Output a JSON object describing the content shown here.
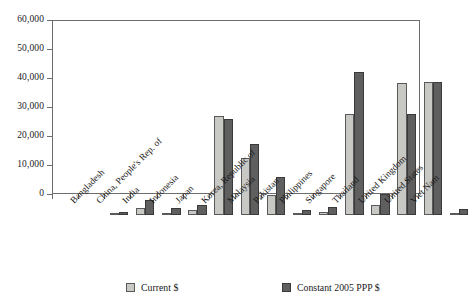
{
  "chart_data": {
    "type": "bar",
    "title": "",
    "xlabel": "",
    "ylabel": "",
    "ylim": [
      0,
      60000
    ],
    "grid": false,
    "legend_position": "bottom",
    "ytick_labels": [
      "0",
      "10,000",
      "20,000",
      "30,000",
      "40,000",
      "50,000",
      "60,000"
    ],
    "ytick_values": [
      0,
      10000,
      20000,
      30000,
      40000,
      50000,
      60000
    ],
    "categories": [
      "Bangladesh",
      "China, People's Rep. of",
      "India",
      "Indonesia",
      "Japan",
      "Korea, Republic of",
      "Malaysia",
      "Pakistan",
      "Philippines",
      "Singapore",
      "Thailand",
      "United Kingdom",
      "United States",
      "Viet Nam"
    ],
    "series": [
      {
        "name": "Current $",
        "color": "#c8c8c4",
        "values": [
          700,
          2300,
          600,
          1600,
          34000,
          19500,
          6800,
          600,
          1200,
          35000,
          3300,
          45500,
          45700,
          500
        ]
      },
      {
        "name": "Constant 2005 PPP $",
        "color": "#5f5f5f",
        "values": [
          1200,
          5100,
          2300,
          3500,
          33200,
          24500,
          13000,
          1900,
          2600,
          49400,
          7400,
          34800,
          45700,
          2200
        ]
      }
    ]
  },
  "legend": {
    "entries": [
      {
        "label": "Current $",
        "color": "#c8c8c4"
      },
      {
        "label": "Constant 2005 PPP $",
        "color": "#5f5f5f"
      }
    ]
  }
}
